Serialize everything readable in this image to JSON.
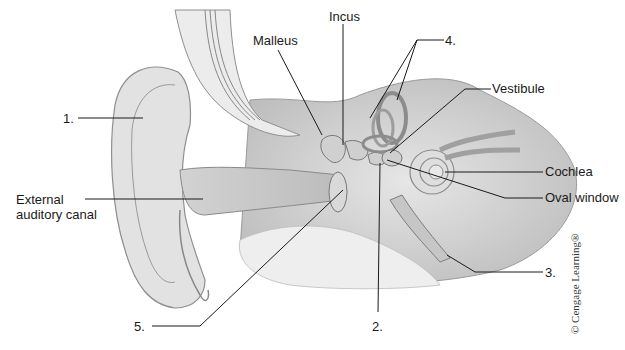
{
  "diagram": {
    "labels": {
      "malleus": "Malleus",
      "incus": "Incus",
      "vestibule": "Vestibule",
      "cochlea": "Cochlea",
      "oval_window": "Oval window",
      "external_auditory_canal_line1": "External",
      "external_auditory_canal_line2": "auditory canal",
      "num1": "1.",
      "num2": "2.",
      "num3": "3.",
      "num4": "4.",
      "num5": "5."
    },
    "copyright": "© Cengage Learning®"
  }
}
